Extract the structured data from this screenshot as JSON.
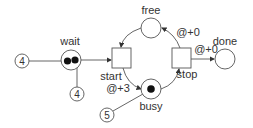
{
  "diagram": {
    "type": "petri-net",
    "places": [
      {
        "id": "wait",
        "label": "wait",
        "tokens": 2
      },
      {
        "id": "free",
        "label": "free",
        "tokens": 0
      },
      {
        "id": "busy",
        "label": "busy",
        "tokens": 1
      },
      {
        "id": "done",
        "label": "done",
        "tokens": 0
      }
    ],
    "transitions": [
      {
        "id": "start",
        "label": "start"
      },
      {
        "id": "stop",
        "label": "stop"
      }
    ],
    "arc_labels": {
      "start_busy": "@+3",
      "stop_free": "@+0",
      "stop_done": "@+0"
    },
    "token_timestamps": {
      "wait_left": "4",
      "wait_bottom": "4",
      "busy": "5"
    }
  },
  "colors": {
    "stroke": "#555555",
    "token": "#111111",
    "text": "#333333"
  }
}
